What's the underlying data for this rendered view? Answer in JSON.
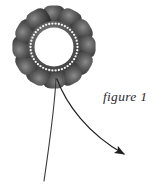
{
  "canvas": {
    "width": 162,
    "height": 185,
    "background_color": "#ffffff"
  },
  "caption": {
    "text": "figure 1",
    "color": "#2b2b2b",
    "style": "italic-serif"
  },
  "illustration": {
    "name": "flower-with-pointer-arrow",
    "subject": "stylized dark flower ring with beaded inner circle",
    "flower": {
      "center_x": 54,
      "center_y": 47,
      "petal_count": 12,
      "petal_radius": 31,
      "petal_size": 11.5,
      "petal_color_dark": "#2e2e2e",
      "petal_color_mid": "#4a4a4a",
      "petal_color_light": "#7d7d7d",
      "ring_outer_radius": 26,
      "ring_inner_radius": 20,
      "ring_band_color": "#555555",
      "center_fill": "#ffffff",
      "bead_color": "#f2f2f2",
      "bead_count": 46,
      "bead_radius": 1.15,
      "bead_ring_radius": 23.5
    },
    "stem": {
      "color": "#3a3a3a",
      "width": 1.1,
      "start_x": 56,
      "start_y": 78,
      "end_x": 44,
      "end_y": 181
    },
    "arrow": {
      "color": "#1f1f1f",
      "width": 1.2,
      "start_x": 57,
      "start_y": 79,
      "end_x": 128,
      "end_y": 157,
      "head_length": 9,
      "head_width": 7,
      "direction": "down-right"
    }
  }
}
